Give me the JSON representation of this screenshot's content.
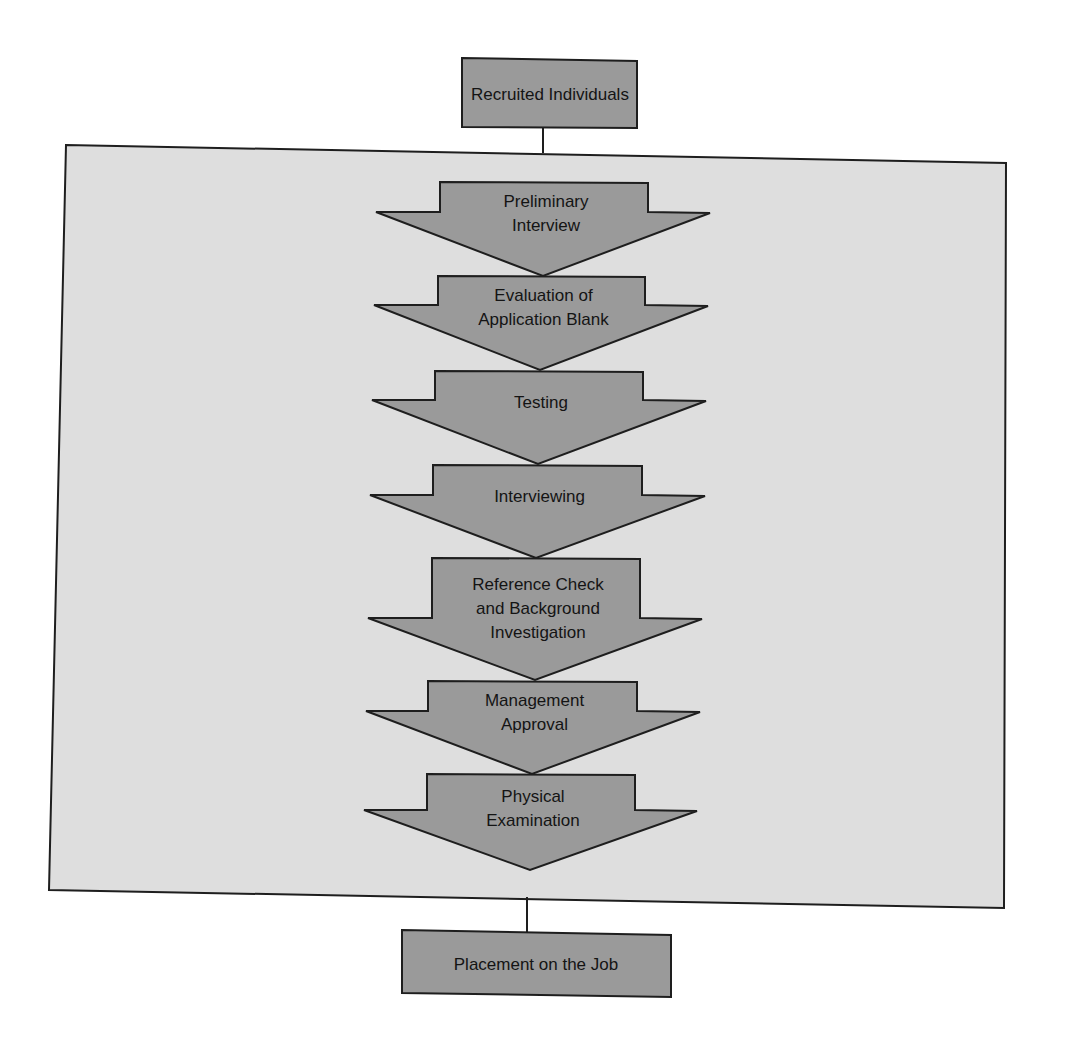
{
  "diagram": {
    "type": "flowchart",
    "title": "",
    "colors": {
      "background": "#ffffff",
      "panel_fill": "#dedede",
      "shape_fill": "#9a9a9a",
      "stroke": "#1e1e1e",
      "text": "#141414"
    },
    "start_node": {
      "label": "Recruited Individuals"
    },
    "steps": [
      {
        "lines": [
          "Preliminary",
          "Interview"
        ]
      },
      {
        "lines": [
          "Evaluation of",
          "Application Blank"
        ]
      },
      {
        "lines": [
          "Testing"
        ]
      },
      {
        "lines": [
          "Interviewing"
        ]
      },
      {
        "lines": [
          "Reference Check",
          "and Background",
          "Investigation"
        ]
      },
      {
        "lines": [
          "Management",
          "Approval"
        ]
      },
      {
        "lines": [
          "Physical",
          "Examination"
        ]
      }
    ],
    "end_node": {
      "label": "Placement on the Job"
    },
    "edges": [
      {
        "from": "Recruited Individuals",
        "to": "selection-steps-panel"
      },
      {
        "from": "selection-steps-panel",
        "to": "Placement on the Job"
      }
    ]
  }
}
